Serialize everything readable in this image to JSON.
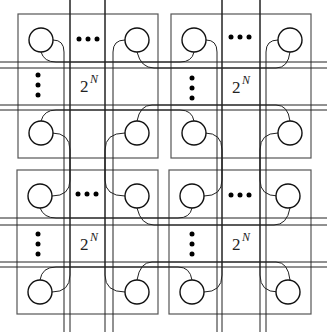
{
  "diagram": {
    "type": "hierarchical-network",
    "modules": [
      {
        "id": "top-left",
        "label_base": "2",
        "label_exp": "N"
      },
      {
        "id": "top-right",
        "label_base": "2",
        "label_exp": "N"
      },
      {
        "id": "bottom-left",
        "label_base": "2",
        "label_exp": "N"
      },
      {
        "id": "bottom-right",
        "label_base": "2",
        "label_exp": "N"
      }
    ],
    "nodes_per_module_shown": 4,
    "ellipsis": {
      "horizontal": "•••",
      "vertical": "⋮"
    },
    "colors": {
      "box": "#555555",
      "node": "#111111",
      "wire": "#222222",
      "background": "#ffffff"
    }
  }
}
